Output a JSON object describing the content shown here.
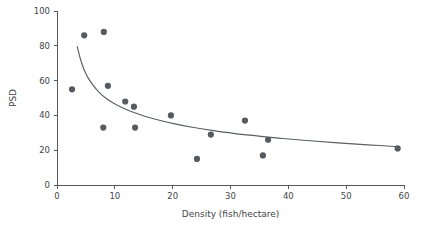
{
  "chart_data": {
    "type": "scatter",
    "title": "",
    "xlabel": "Density (fish/hectare)",
    "ylabel": "PSD",
    "xlim": [
      0,
      60
    ],
    "ylim": [
      0,
      100
    ],
    "xticks": [
      0,
      10,
      20,
      30,
      40,
      50,
      60
    ],
    "yticks": [
      0,
      20,
      40,
      60,
      80,
      100
    ],
    "xtick_labels": [
      "0",
      "10",
      "20",
      "30",
      "40",
      "50",
      "60"
    ],
    "ytick_labels": [
      "0",
      "20",
      "40",
      "60",
      "80",
      "100"
    ],
    "grid": false,
    "legend": false,
    "marker_color": "#565b60",
    "curve_color": "#5a5f64",
    "axis_color": "#55595e",
    "background_color": "#ffffff",
    "points": [
      {
        "x": 2.6,
        "y": 55
      },
      {
        "x": 4.7,
        "y": 86
      },
      {
        "x": 8.1,
        "y": 88
      },
      {
        "x": 8.8,
        "y": 57
      },
      {
        "x": 8.0,
        "y": 33
      },
      {
        "x": 11.8,
        "y": 48
      },
      {
        "x": 13.3,
        "y": 45
      },
      {
        "x": 13.5,
        "y": 33
      },
      {
        "x": 19.7,
        "y": 40
      },
      {
        "x": 24.2,
        "y": 15
      },
      {
        "x": 26.6,
        "y": 29
      },
      {
        "x": 32.5,
        "y": 37
      },
      {
        "x": 35.6,
        "y": 17
      },
      {
        "x": 36.5,
        "y": 26
      },
      {
        "x": 58.9,
        "y": 21
      }
    ],
    "trend_curve": {
      "description": "decaying power-law fit through the scatter",
      "x_start": 3.5,
      "x_end": 59.0,
      "points": [
        {
          "x": 3.5,
          "y": 79.5
        },
        {
          "x": 4.0,
          "y": 73.0
        },
        {
          "x": 4.6,
          "y": 67.0
        },
        {
          "x": 5.3,
          "y": 62.0
        },
        {
          "x": 6.2,
          "y": 57.5
        },
        {
          "x": 7.2,
          "y": 53.5
        },
        {
          "x": 8.4,
          "y": 50.0
        },
        {
          "x": 9.8,
          "y": 47.0
        },
        {
          "x": 11.4,
          "y": 44.3
        },
        {
          "x": 13.2,
          "y": 41.8
        },
        {
          "x": 15.3,
          "y": 39.4
        },
        {
          "x": 17.7,
          "y": 37.2
        },
        {
          "x": 20.4,
          "y": 35.1
        },
        {
          "x": 23.4,
          "y": 33.2
        },
        {
          "x": 26.8,
          "y": 31.4
        },
        {
          "x": 30.5,
          "y": 29.7
        },
        {
          "x": 34.6,
          "y": 28.2
        },
        {
          "x": 39.0,
          "y": 26.7
        },
        {
          "x": 43.7,
          "y": 25.4
        },
        {
          "x": 48.6,
          "y": 24.2
        },
        {
          "x": 53.7,
          "y": 23.1
        },
        {
          "x": 59.0,
          "y": 22.0
        }
      ]
    }
  },
  "axes": {
    "y_title": "PSD",
    "x_title": "Density (fish/hectare)"
  }
}
